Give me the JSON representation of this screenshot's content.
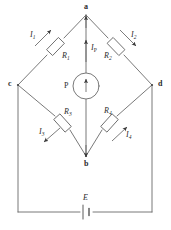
{
  "figure": {
    "kind": "wheatstone-bridge-circuit-diagram",
    "line_color": "#5a5a5a",
    "text_color": "#2b2b2b",
    "background": "#ffffff"
  },
  "nodes": [
    {
      "id": "a",
      "label": "a",
      "x": 86,
      "y": 15
    },
    {
      "id": "c",
      "label": "c",
      "x": 18,
      "y": 85
    },
    {
      "id": "d",
      "label": "d",
      "x": 152,
      "y": 85
    },
    {
      "id": "b",
      "label": "b",
      "x": 86,
      "y": 156
    }
  ],
  "components": {
    "r1": {
      "label": "R",
      "subscript": "1"
    },
    "r2": {
      "label": "R",
      "subscript": "2"
    },
    "r3": {
      "label": "R",
      "subscript": "3"
    },
    "r4": {
      "label": "R",
      "subscript": "4"
    },
    "galvanometer": {
      "label": "P"
    },
    "battery": {
      "label": "E"
    }
  },
  "currents": {
    "i1": {
      "label": "I",
      "subscript": "1",
      "direction": "up-right"
    },
    "i2": {
      "label": "I",
      "subscript": "2",
      "direction": "down-right"
    },
    "i3": {
      "label": "I",
      "subscript": "3",
      "direction": "down-left"
    },
    "i4": {
      "label": "I",
      "subscript": "4",
      "direction": "up-right"
    },
    "ip": {
      "label": "I",
      "subscript": "P",
      "direction": "up"
    }
  }
}
